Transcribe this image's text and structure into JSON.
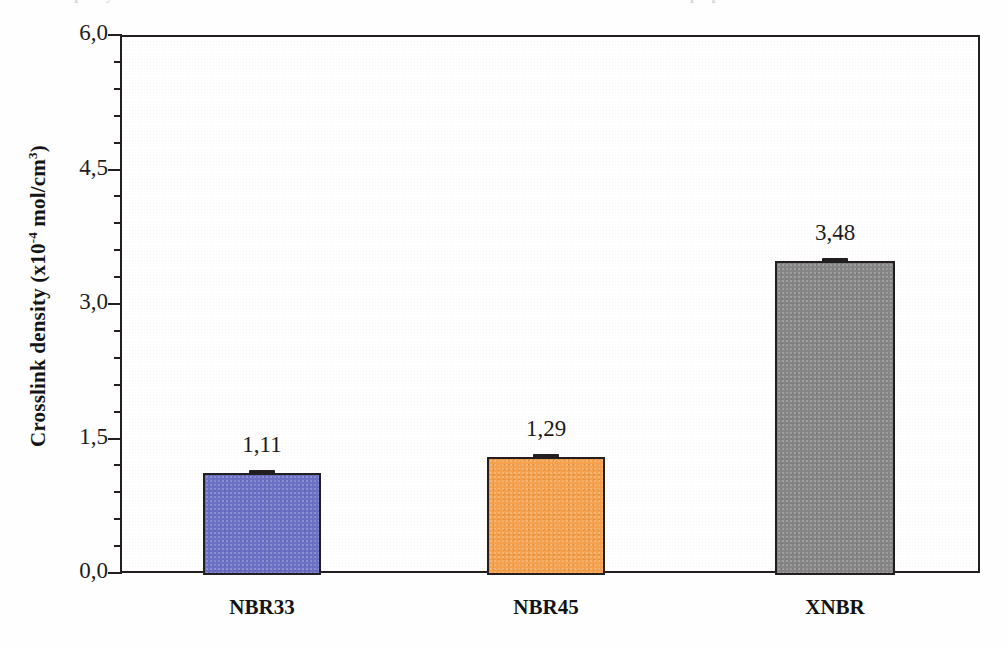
{
  "figure": {
    "axis_title_main": "Crosslink density (x10",
    "axis_title_exp": "-4",
    "axis_title_tail": " mol/cm",
    "axis_title_tail_exp": "3",
    "axis_title_close": ")",
    "axis_title_plain": "Crosslink density (x10-4 mol/cm3)"
  },
  "scan": {
    "top_fragment_left": "capacity of the NBR and XNBR vulcanizates",
    "top_fragment_right": "preparation"
  },
  "chart_data": {
    "type": "bar",
    "title": "",
    "subtitle": "",
    "xlabel": "",
    "ylabel": "Crosslink density (x10-4 mol/cm3)",
    "categories": [
      "NBR33",
      "NBR45",
      "XNBR"
    ],
    "values": [
      1.11,
      1.29,
      3.48
    ],
    "value_labels": [
      "1,11",
      "1,29",
      "3,48"
    ],
    "errors": [
      0.03,
      0.03,
      0.04
    ],
    "colors": [
      "#6b70c4",
      "#f5a04c",
      "#858585"
    ],
    "ylim": [
      0.0,
      6.0
    ],
    "ytick_values": [
      0.0,
      1.5,
      3.0,
      4.5,
      6.0
    ],
    "ytick_labels": [
      "0,0",
      "1,5",
      "3,0",
      "4,5",
      "6,0"
    ],
    "minor_ticks_per_interval": 4,
    "minor_tick_step": 0.3,
    "grid": false,
    "legend": false,
    "legend_position": "none",
    "decimal_separator": "comma",
    "bar_edge_color": "#231f20",
    "frame": true,
    "annotations": []
  }
}
